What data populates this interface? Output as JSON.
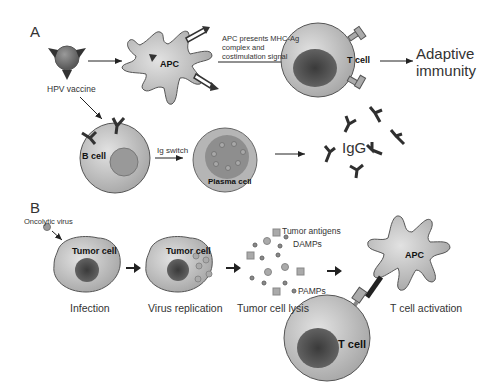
{
  "panel_a": {
    "label": "A",
    "hpv_vaccine": "HPV vaccine",
    "apc": "APC",
    "apc_presents": [
      "APC presents MHC-Ag",
      "complex and",
      "costimulation signal"
    ],
    "t_cell": "T cell",
    "adaptive": [
      "Adaptive",
      "immunity"
    ],
    "b_cell": "B cell",
    "ig_switch": "Ig switch",
    "plasma_cell": "Plasma cell",
    "igg": "IgG"
  },
  "panel_b": {
    "label": "B",
    "oncolytic_virus": "Oncolytic virus",
    "tumor_cell_1": "Tumor cell",
    "tumor_cell_2": "Tumor cell",
    "legend": {
      "tumor_antigens": "Tumor antigens",
      "damps": "DAMPs",
      "pamps": "PAMPs"
    },
    "apc": "APC",
    "t_cell": "T cell",
    "steps": [
      "Infection",
      "Virus replication",
      "Tumor cell lysis",
      "T cell activation"
    ]
  },
  "colors": {
    "cell_fill": "#b9b9b9",
    "nucleus": "#4a4a4a",
    "receptor": "#3a3a3a",
    "outline": "#555555"
  }
}
